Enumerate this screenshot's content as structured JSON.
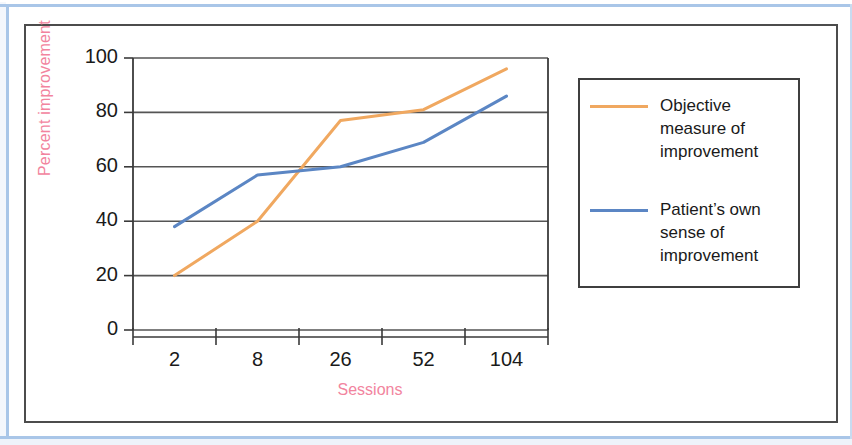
{
  "figure": {
    "frame_color": "#4c4c4c",
    "page_rule_color": "#a9c6e8"
  },
  "chart_data": {
    "type": "line",
    "title": "",
    "subtitle": "",
    "xlabel": "Sessions",
    "ylabel": "Percent improvement",
    "categories": [
      "2",
      "8",
      "26",
      "52",
      "104"
    ],
    "x_tick_labels": [
      "2",
      "8",
      "26",
      "52",
      "104"
    ],
    "y_tick_labels": [
      "0",
      "20",
      "40",
      "60",
      "80",
      "100"
    ],
    "ylim": [
      0,
      100
    ],
    "y_ticks": [
      0,
      20,
      40,
      60,
      80,
      100
    ],
    "grid": "horizontal",
    "legend_position": "right-outside",
    "series": [
      {
        "name": "Objective measure of improvement",
        "legend_label_lines": [
          "Objective",
          "measure of",
          "improvement"
        ],
        "color": "#f0a860",
        "values": [
          20,
          40,
          77,
          81,
          96
        ]
      },
      {
        "name": "Patient's own sense of improvement",
        "legend_label_lines": [
          "Patient’s own",
          "sense of",
          "improvement"
        ],
        "color": "#5b86c4",
        "values": [
          38,
          57,
          60,
          69,
          86
        ]
      }
    ]
  },
  "axis": {
    "label_color": "#f2849e",
    "tick_color": "#1a1a1a",
    "axis_line_color": "#3a3a3a",
    "gridline_color": "#555555"
  },
  "legend": {
    "border_color": "#3f3f3f",
    "entries": [
      {
        "label": "Objective measure of improvement",
        "color": "#f0a860"
      },
      {
        "label": "Patient's own sense of improvement",
        "color": "#5b86c4"
      }
    ]
  }
}
